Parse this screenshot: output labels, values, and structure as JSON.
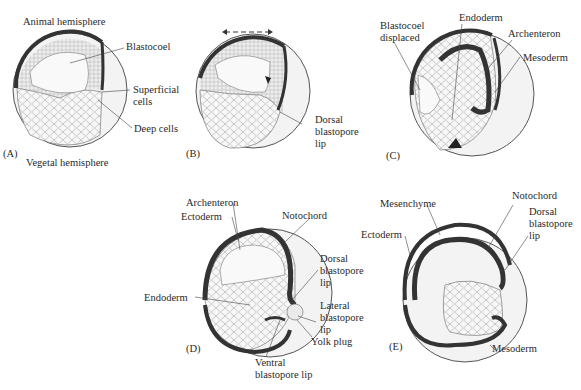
{
  "panels": {
    "A": {
      "id": "(A)",
      "labels": [
        "Animal hemisphere",
        "Blastocoel",
        "Superficial\ncells",
        "Deep cells",
        "Vegetal hemisphere"
      ]
    },
    "B": {
      "id": "(B)",
      "labels": [
        "Dorsal\nblastopore\nlip"
      ]
    },
    "C": {
      "id": "(C)",
      "labels": [
        "Blastocoel\ndisplaced",
        "Endoderm",
        "Archenteron",
        "Mesoderm"
      ]
    },
    "D": {
      "id": "(D)",
      "labels": [
        "Archenteron",
        "Ectoderm",
        "Notochord",
        "Dorsal\nblastopore\nlip",
        "Endoderm",
        "Lateral\nblastopore\nlip",
        "Yolk plug",
        "Ventral\nblastopore lip"
      ]
    },
    "E": {
      "id": "(E)",
      "labels": [
        "Notochord",
        "Mesenchyme",
        "Dorsal\nblastopore\nlip",
        "Ectoderm",
        "Mesoderm"
      ]
    }
  },
  "colors": {
    "outline": "#333333",
    "dark_layer": "#3a3a3a",
    "cells": "#f4f4f4",
    "background": "#ffffff"
  }
}
